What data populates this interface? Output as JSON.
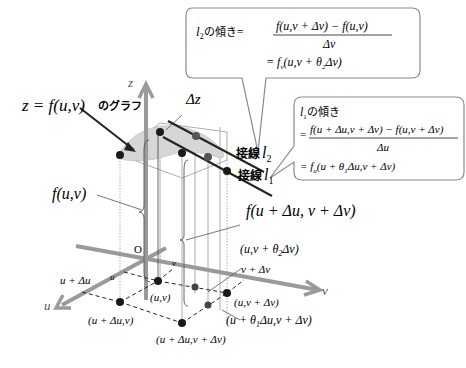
{
  "diagram": {
    "type": "3d-partial-derivative-mean-value-illustration",
    "axes": {
      "z": "z",
      "u": "u",
      "v": "v",
      "origin": "O"
    },
    "graph_label": {
      "formula": "z = f(u,v)",
      "suffix": "のグラフ"
    },
    "delta_z": "Δz",
    "tangents": [
      {
        "prefix": "接線",
        "name": "l",
        "sub": "2"
      },
      {
        "prefix": "接線",
        "name": "l",
        "sub": "1"
      }
    ],
    "heights": {
      "left": "f(u,v)",
      "right": "f(u + Δu, v + Δv)"
    },
    "callout_l2": {
      "lhs_name": "l",
      "lhs_sub": "2",
      "lhs_suffix": "の傾き",
      "eq": "=",
      "numerator": "f(u,v + Δv) − f(u,v)",
      "denominator": "Δv",
      "result": "= f",
      "result_sub": "v",
      "result_args": "(u,v + θ",
      "result_theta_sub": "2",
      "result_tail": "Δv)"
    },
    "callout_l1": {
      "lhs_name": "l",
      "lhs_sub": "1",
      "lhs_suffix": "の傾き",
      "eq": "=",
      "numerator": "f(u + Δu,v + Δv) − f(u,v + Δv)",
      "denominator": "Δu",
      "result": "= f",
      "result_sub": "u",
      "result_args": "(u + θ",
      "result_theta_sub": "1",
      "result_tail": "Δu,v + Δv)"
    },
    "axis_ticks": {
      "u_plus_du": "u + Δu",
      "u_small": "u",
      "v_small": "v",
      "v_plus_dv": "v + Δv"
    },
    "points": {
      "uv": "(u,v)",
      "u_du_v": "(u + Δu,v)",
      "u_du_v_dv": "(u + Δu,v + Δv)",
      "u_v_dv": "(u,v + Δv)",
      "theta2": {
        "pre": "(u,v + θ",
        "sub": "2",
        "post": "Δv)"
      },
      "theta1": {
        "pre": "(u + θ",
        "sub": "1",
        "post": "Δu,v + Δv)"
      }
    },
    "colors": {
      "axis": "#9a9a9a",
      "surface": "#d6d6d6",
      "line": "#222222",
      "thin": "#777777",
      "callout_border": "#8a8a8a",
      "callout_fill": "#ffffff"
    }
  }
}
